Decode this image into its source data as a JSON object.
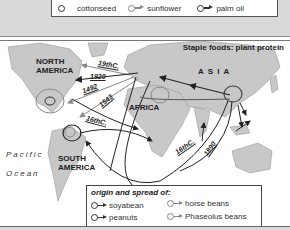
{
  "top_legend": {
    "items": [
      {
        "label": "cottonseed",
        "symbol": "circle",
        "color": "#333333"
      },
      {
        "label": "sunflower",
        "symbol": "circle-arrow",
        "color": "#888888"
      },
      {
        "label": "palm oil",
        "symbol": "circle-arrow",
        "color": "#333333"
      }
    ]
  },
  "map": {
    "title": "Staple foods: plant protein",
    "regions": {
      "north_america": "NORTH AMERICA",
      "south_america": "SOUTH AMERICA",
      "africa": "AFRICA",
      "asia": "A S I A"
    },
    "ocean": {
      "line1": "Pacific",
      "line2": "Ocean"
    },
    "dates": [
      "19thC.",
      "1920",
      "1492",
      "1543",
      "16thC.",
      "16thC.",
      "1890"
    ]
  },
  "bottom_legend": {
    "title": "origin and spread of:",
    "items": [
      {
        "label": "soyabean",
        "color": "#222222"
      },
      {
        "label": "peanuts",
        "color": "#222222"
      },
      {
        "label": "horse beans",
        "color": "#888888"
      },
      {
        "label": "Phaseolus beans",
        "color": "#888888"
      }
    ]
  }
}
